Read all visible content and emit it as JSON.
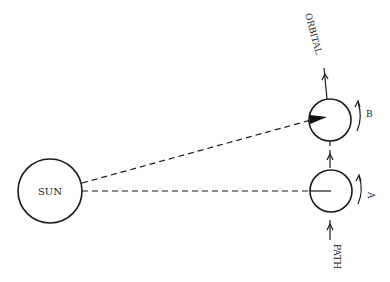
{
  "diagram": {
    "sun": {
      "label": "SUN"
    },
    "positions": [
      {
        "id": "A",
        "label": "A"
      },
      {
        "id": "B",
        "label": "B"
      }
    ],
    "path_labels": {
      "top": "ORBITAL",
      "bottom": "PATH"
    },
    "colors": {
      "stroke": "#1a1a1a",
      "background": "#ffffff"
    }
  }
}
